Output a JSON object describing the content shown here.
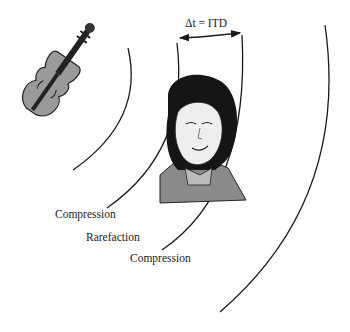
{
  "diagram": {
    "itd_label": "Δt = ITD",
    "labels": {
      "compression_1": "Compression",
      "rarefaction": "Rarefaction",
      "compression_2": "Compression"
    },
    "icons": {
      "source": "violin-icon",
      "listener": "woman-head-icon"
    },
    "colors": {
      "line": "#1a1a1a",
      "violin_body": "#9a9a9a",
      "hair": "#151515",
      "skin": "#eeeeee",
      "clothing": "#8a8a8a"
    }
  }
}
